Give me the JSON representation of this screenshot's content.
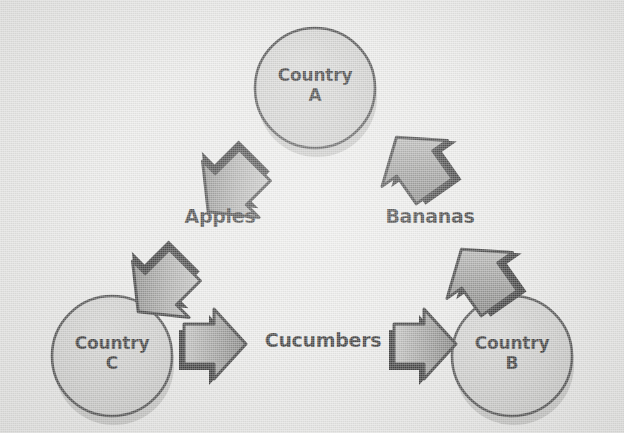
{
  "diagram": {
    "type": "cycle-diagram",
    "background_color": "#e8e8e6",
    "node_fill_color": "#c9c9c7",
    "node_stroke_color": "#3a3a3a",
    "arrow_fill_light": "#b9b9b7",
    "arrow_fill_dark": "#6e6e6c",
    "arrow_edge_color": "#151515",
    "text_color": "#121212"
  },
  "nodes": [
    {
      "id": "country-a",
      "line1": "Country",
      "line2": "A",
      "cx": 315,
      "cy": 88,
      "r": 60
    },
    {
      "id": "country-c",
      "line1": "Country",
      "line2": "C",
      "cx": 112,
      "cy": 356,
      "r": 60
    },
    {
      "id": "country-b",
      "line1": "Country",
      "line2": "B",
      "cx": 512,
      "cy": 356,
      "r": 60
    }
  ],
  "edges": [
    {
      "id": "edge-apples",
      "label": "Apples",
      "from": "country-a",
      "to": "country-c",
      "direction": "down-left",
      "arrow_count": 2
    },
    {
      "id": "edge-cucumbers",
      "label": "Cucumbers",
      "from": "country-c",
      "to": "country-b",
      "direction": "right",
      "arrow_count": 2
    },
    {
      "id": "edge-bananas",
      "label": "Bananas",
      "from": "country-b",
      "to": "country-a",
      "direction": "up-left",
      "arrow_count": 2
    }
  ],
  "labels": {
    "country_a_line1": "Country",
    "country_a_line2": "A",
    "country_b_line1": "Country",
    "country_b_line2": "B",
    "country_c_line1": "Country",
    "country_c_line2": "C",
    "apples": "Apples",
    "bananas": "Bananas",
    "cucumbers": "Cucumbers"
  }
}
